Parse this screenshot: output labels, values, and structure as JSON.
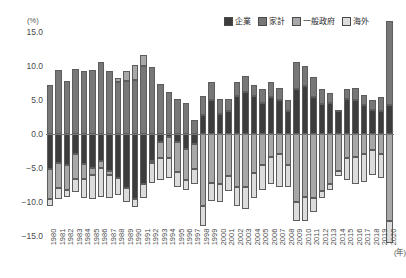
{
  "unit_label": "(%)",
  "x_unit_label": "(年)",
  "legend": {
    "items": [
      {
        "label": "企業",
        "color": "#3d3d3d"
      },
      {
        "label": "家計",
        "color": "#777777"
      },
      {
        "label": "一般政府",
        "color": "#a8a8a8"
      },
      {
        "label": "海外",
        "color": "#dcdcdc"
      }
    ]
  },
  "y_ticks": [
    "15.0",
    "10.0",
    "5.0",
    "0.0",
    "-5.0",
    "-10.0",
    "-15.0"
  ],
  "chart_data": {
    "type": "bar",
    "title": "",
    "subtitle": "",
    "xlabel": "(年)",
    "ylabel": "(%)",
    "ylim": [
      -15.0,
      15.0
    ],
    "ytick_step": 5.0,
    "grid": false,
    "stacked": true,
    "legend_position": "top-right",
    "categories": [
      "1980",
      "1981",
      "1982",
      "1983",
      "1984",
      "1985",
      "1986",
      "1987",
      "1988",
      "1989",
      "1990",
      "1991",
      "1992",
      "1993",
      "1994",
      "1995",
      "1996",
      "1997",
      "1998",
      "1999",
      "2000",
      "2001",
      "2002",
      "2003",
      "2004",
      "2005",
      "2006",
      "2007",
      "2008",
      "2009",
      "2010",
      "2011",
      "2012",
      "2013",
      "2014",
      "2015",
      "2016",
      "2017",
      "2018",
      "2019",
      "2020"
    ],
    "series": [
      {
        "name": "企業",
        "color": "#3d3d3d",
        "values": [
          -5.2,
          -4.2,
          -4.6,
          -3.0,
          -4.4,
          -5.0,
          -4.0,
          -5.4,
          -6.4,
          -8.0,
          -9.6,
          -7.4,
          -4.0,
          -1.2,
          -0.4,
          -1.2,
          -2.2,
          -1.4,
          2.8,
          5.0,
          3.0,
          3.4,
          5.6,
          6.2,
          5.6,
          4.6,
          5.4,
          5.0,
          3.4,
          6.6,
          7.0,
          5.4,
          4.4,
          4.6,
          3.4,
          5.2,
          5.0,
          4.2,
          3.6,
          3.4,
          4.2
        ]
      },
      {
        "name": "家計",
        "color": "#777777",
        "values": [
          7.2,
          9.4,
          7.8,
          9.6,
          9.2,
          9.4,
          10.6,
          9.2,
          7.6,
          7.8,
          8.0,
          10.0,
          9.8,
          7.4,
          6.2,
          5.2,
          4.6,
          2.0,
          2.8,
          2.6,
          2.2,
          1.8,
          2.0,
          2.4,
          1.6,
          2.0,
          2.2,
          1.8,
          1.6,
          4.0,
          3.0,
          3.0,
          2.2,
          1.4,
          0.2,
          1.4,
          1.8,
          1.6,
          1.4,
          2.0,
          12.4
        ]
      },
      {
        "name": "一般政府",
        "color": "#a8a8a8",
        "values": [
          -4.4,
          -3.8,
          -3.6,
          -3.6,
          -2.2,
          -1.0,
          -1.0,
          -0.6,
          0.6,
          1.4,
          2.2,
          1.6,
          -0.2,
          -2.4,
          -3.2,
          -4.4,
          -4.6,
          -3.8,
          -10.6,
          -7.2,
          -7.4,
          -6.2,
          -7.8,
          -7.8,
          -5.8,
          -4.6,
          -3.4,
          -3.0,
          -4.6,
          -10.0,
          -9.2,
          -9.4,
          -8.4,
          -7.4,
          -5.4,
          -3.6,
          -3.4,
          -3.0,
          -2.4,
          -3.0,
          -12.8
        ]
      },
      {
        "name": "海外",
        "color": "#dcdcdc",
        "values": [
          -1.0,
          -1.6,
          -1.0,
          -2.0,
          -2.8,
          -3.6,
          -4.2,
          -3.4,
          -2.6,
          -2.0,
          -1.2,
          -2.0,
          -3.0,
          -3.2,
          -2.8,
          -2.2,
          -1.4,
          -2.2,
          -3.0,
          -2.6,
          -2.6,
          -2.2,
          -2.8,
          -3.2,
          -3.6,
          -3.6,
          -4.0,
          -4.8,
          -3.2,
          -2.8,
          -3.6,
          -2.0,
          -1.0,
          -0.8,
          -0.8,
          -3.2,
          -4.0,
          -4.0,
          -3.6,
          -3.4,
          -3.2
        ]
      }
    ]
  }
}
